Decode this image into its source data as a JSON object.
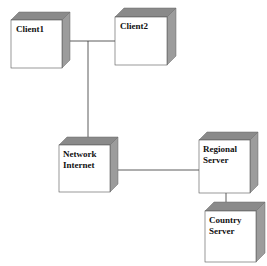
{
  "diagram": {
    "type": "UML deployment diagram",
    "colors": {
      "face": "#ffffff",
      "top": "#8a8a8a",
      "side": "#9a9a9a",
      "edge": "#555555",
      "line": "#333333"
    },
    "nodes": [
      {
        "id": "client1",
        "lines": [
          "Client1"
        ],
        "x": 11,
        "y": 20,
        "w": 51,
        "h": 48,
        "d": 8
      },
      {
        "id": "client2",
        "lines": [
          "Client2"
        ],
        "x": 115,
        "y": 17,
        "w": 52,
        "h": 48,
        "d": 9
      },
      {
        "id": "network",
        "lines": [
          "Network",
          "Internet"
        ],
        "x": 59,
        "y": 145,
        "w": 51,
        "h": 47,
        "d": 8
      },
      {
        "id": "regional",
        "lines": [
          "Regional",
          "Server"
        ],
        "x": 199,
        "y": 140,
        "w": 51,
        "h": 53,
        "d": 8
      },
      {
        "id": "country",
        "lines": [
          "Country",
          "Server"
        ],
        "x": 205,
        "y": 211,
        "w": 51,
        "h": 51,
        "d": 9
      }
    ],
    "connections": [
      {
        "from": "client1",
        "to": "client2"
      },
      {
        "from": "client1",
        "to": "network"
      },
      {
        "from": "network",
        "to": "regional"
      },
      {
        "from": "regional",
        "to": "country"
      }
    ]
  }
}
